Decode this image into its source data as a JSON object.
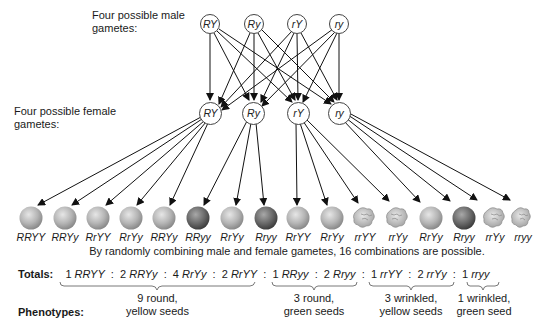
{
  "male_gametes": {
    "label": "Four possible male gametes:",
    "items": [
      "RY",
      "Ry",
      "rY",
      "ry"
    ]
  },
  "female_gametes": {
    "label": "Four possible female gametes:",
    "items": [
      "RY",
      "Ry",
      "rY",
      "ry"
    ]
  },
  "offspring": [
    {
      "genotype": "RRYY",
      "phenotype": "round-yellow"
    },
    {
      "genotype": "RRYy",
      "phenotype": "round-yellow"
    },
    {
      "genotype": "RrYY",
      "phenotype": "round-yellow"
    },
    {
      "genotype": "RrYy",
      "phenotype": "round-yellow"
    },
    {
      "genotype": "RRYy",
      "phenotype": "round-yellow"
    },
    {
      "genotype": "RRyy",
      "phenotype": "round-green"
    },
    {
      "genotype": "RrYy",
      "phenotype": "round-yellow"
    },
    {
      "genotype": "Rryy",
      "phenotype": "round-green"
    },
    {
      "genotype": "RrYY",
      "phenotype": "round-yellow"
    },
    {
      "genotype": "RrYy",
      "phenotype": "round-yellow"
    },
    {
      "genotype": "rrYY",
      "phenotype": "wrinkled-yellow"
    },
    {
      "genotype": "rrYy",
      "phenotype": "wrinkled-yellow"
    },
    {
      "genotype": "RrYy",
      "phenotype": "round-yellow"
    },
    {
      "genotype": "Rryy",
      "phenotype": "round-green"
    },
    {
      "genotype": "rrYy",
      "phenotype": "wrinkled-yellow"
    },
    {
      "genotype": "rryy",
      "phenotype": "wrinkled-green"
    }
  ],
  "caption": "By randomly combining male and female gametes, 16 combinations are possible.",
  "totals": {
    "label": "Totals:",
    "items": [
      {
        "count": "1",
        "genotype": "RRYY"
      },
      {
        "count": "2",
        "genotype": "RRYy"
      },
      {
        "count": "4",
        "genotype": "RrYy"
      },
      {
        "count": "2",
        "genotype": "RrYY"
      },
      {
        "count": "1",
        "genotype": "RRyy"
      },
      {
        "count": "2",
        "genotype": "Rryy"
      },
      {
        "count": "1",
        "genotype": "rrYY"
      },
      {
        "count": "2",
        "genotype": "rrYy"
      },
      {
        "count": "1",
        "genotype": "rryy"
      }
    ]
  },
  "phenotypes": {
    "label": "Phenotypes:",
    "groups": [
      {
        "line1": "9 round,",
        "line2": "yellow seeds"
      },
      {
        "line1": "3 round,",
        "line2": "green seeds"
      },
      {
        "line1": "3 wrinkled,",
        "line2": "yellow seeds"
      },
      {
        "line1": "1 wrinkled,",
        "line2": "green seed"
      }
    ]
  },
  "colors": {
    "yellow_seed": "#b9b9b9",
    "green_seed": "#6e6e6e",
    "wrinkled_seed": "#c4c4c4",
    "line": "#111111"
  }
}
